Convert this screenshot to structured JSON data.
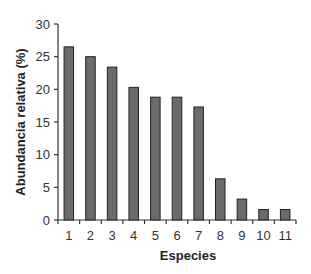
{
  "chart_data": {
    "type": "bar",
    "title": "",
    "xlabel": "Especies",
    "ylabel": "Abundancia relativa (%)",
    "categories": [
      "1",
      "2",
      "3",
      "4",
      "5",
      "6",
      "7",
      "8",
      "9",
      "10",
      "11"
    ],
    "values": [
      26.5,
      25.0,
      23.4,
      20.3,
      18.8,
      18.8,
      17.3,
      6.3,
      3.2,
      1.6,
      1.6
    ],
    "ylim": [
      0,
      30
    ],
    "yticks": [
      0,
      5,
      10,
      15,
      20,
      25,
      30
    ],
    "grid": false,
    "legend": null,
    "bar_color": "#6b6b6b",
    "bar_edge_color": "#222222"
  }
}
